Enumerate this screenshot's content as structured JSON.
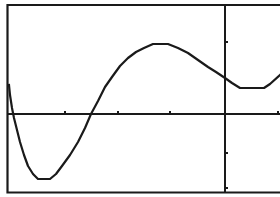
{
  "chart_data": {
    "type": "line",
    "title": "",
    "xlabel": "",
    "ylabel": "",
    "grid": false,
    "legend": null,
    "axes": {
      "x_axis_pixel_y": 114,
      "y_axis_pixel_x": 225,
      "x_tick_pixels": [
        65,
        118,
        170,
        225,
        278
      ],
      "y_tick_pixels": [
        42,
        153,
        188
      ]
    },
    "series": [
      {
        "name": "f(x)",
        "color": "#1a1a1a",
        "points_px": [
          [
            9,
            85
          ],
          [
            10,
            95
          ],
          [
            12,
            108
          ],
          [
            14,
            118
          ],
          [
            17,
            130
          ],
          [
            20,
            142
          ],
          [
            24,
            155
          ],
          [
            28,
            166
          ],
          [
            33,
            174
          ],
          [
            38,
            179
          ],
          [
            50,
            179
          ],
          [
            56,
            174
          ],
          [
            62,
            166
          ],
          [
            70,
            155
          ],
          [
            78,
            142
          ],
          [
            85,
            128
          ],
          [
            91,
            114
          ],
          [
            98,
            101
          ],
          [
            105,
            87
          ],
          [
            112,
            77
          ],
          [
            120,
            66
          ],
          [
            128,
            58
          ],
          [
            136,
            52
          ],
          [
            144,
            48
          ],
          [
            153,
            44
          ],
          [
            168,
            44
          ],
          [
            178,
            48
          ],
          [
            188,
            53
          ],
          [
            198,
            60
          ],
          [
            208,
            67
          ],
          [
            216,
            72
          ],
          [
            225,
            78
          ],
          [
            232,
            83
          ],
          [
            240,
            88
          ],
          [
            264,
            88
          ],
          [
            270,
            84
          ],
          [
            280,
            75
          ]
        ]
      }
    ]
  },
  "graph": {
    "frame_color": "#1a1a1a",
    "background": "#ffffff"
  }
}
